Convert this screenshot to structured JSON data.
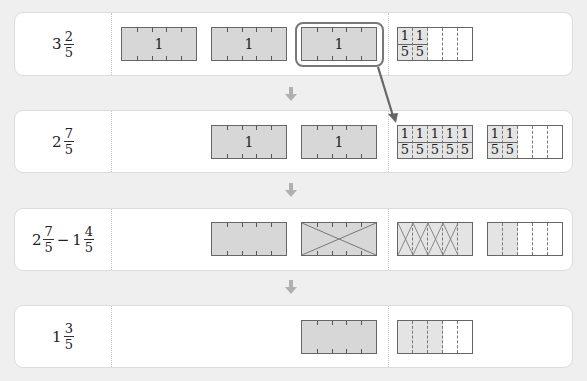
{
  "diagram": {
    "colors": {
      "background": "#efefef",
      "card": "#ffffff",
      "bar_fill": "#d7d7d7",
      "bar_border": "#666666",
      "arrow": "#b0b0b0",
      "pointer": "#666666"
    },
    "rows": [
      {
        "label": {
          "whole": "3",
          "num": "2",
          "den": "5"
        },
        "whole_bars": [
          "1",
          "1",
          "1"
        ],
        "fraction_bars": [
          {
            "numerators": [
              "1",
              "1"
            ],
            "denominators": [
              "5",
              "5"
            ],
            "parts": 5,
            "shaded": 2
          }
        ]
      },
      {
        "label": {
          "whole": "2",
          "num": "7",
          "den": "5"
        },
        "whole_bars": [
          "1",
          "1"
        ],
        "fraction_bars": [
          {
            "numerators": [
              "1",
              "1",
              "1",
              "1",
              "1"
            ],
            "denominators": [
              "5",
              "5",
              "5",
              "5",
              "5"
            ],
            "parts": 5,
            "shaded": 5
          },
          {
            "numerators": [
              "1",
              "1"
            ],
            "denominators": [
              "5",
              "5"
            ],
            "parts": 5,
            "shaded": 2
          }
        ]
      },
      {
        "label": {
          "whole1": "2",
          "num1": "7",
          "den1": "5",
          "operator": "−",
          "whole2": "1",
          "num2": "4",
          "den2": "5"
        },
        "whole_bars": [
          "",
          ""
        ],
        "crossed_whole_bar_index": 1,
        "fraction_bars": [
          {
            "parts": 5,
            "shaded": 5,
            "crossed": 4
          },
          {
            "parts": 5,
            "shaded": 2,
            "crossed": 0
          }
        ]
      },
      {
        "label": {
          "whole": "1",
          "num": "3",
          "den": "5"
        },
        "whole_bars": [
          ""
        ],
        "fraction_bars": [
          {
            "parts": 5,
            "shaded": 3
          }
        ]
      }
    ],
    "arrows": [
      "down",
      "down",
      "down"
    ],
    "annotation": "one whole regrouped into five fifths"
  }
}
